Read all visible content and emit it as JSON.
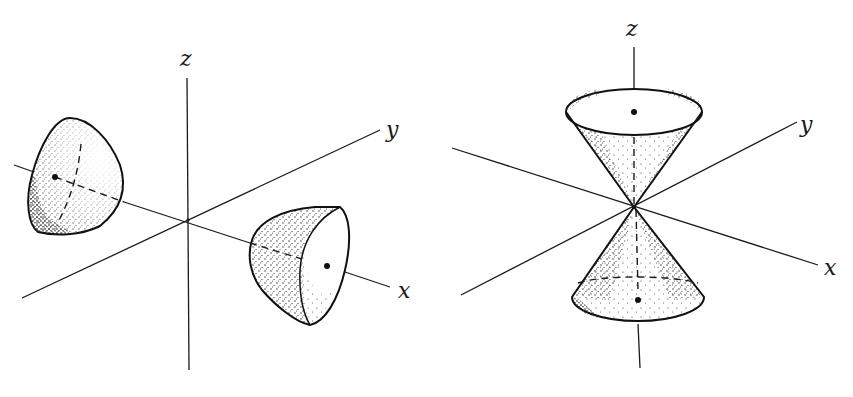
{
  "figure": {
    "colors": {
      "ink": "#1a1a1a",
      "background": "#ffffff"
    },
    "panels": [
      {
        "id": "left",
        "surface": "hyperboloid of two sheets",
        "axes": {
          "z": "z",
          "y": "y",
          "x": "x"
        }
      },
      {
        "id": "right",
        "surface": "elliptic double cone",
        "axes": {
          "z": "z",
          "y": "y",
          "x": "x"
        }
      }
    ]
  }
}
